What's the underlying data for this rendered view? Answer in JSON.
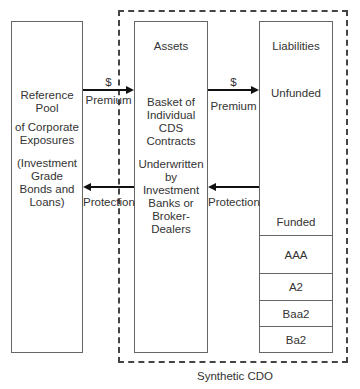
{
  "reference_pool": {
    "line1": "Reference",
    "line2": "Pool",
    "line3": "of Corporate",
    "line4": "Exposures",
    "line5": "(Investment",
    "line6": "Grade",
    "line7": "Bonds and",
    "line8": "Loans)"
  },
  "assets": {
    "title": "Assets",
    "desc1": "Basket of",
    "desc2": "Individual",
    "desc3": "CDS",
    "desc4": "Contracts",
    "desc5": "Underwritten",
    "desc6": "by",
    "desc7": "Investment",
    "desc8": "Banks or",
    "desc9": "Broker-",
    "desc10": "Dealers"
  },
  "liabilities": {
    "title": "Liabilities",
    "unfunded": "Unfunded",
    "funded": "Funded",
    "tranches": [
      "AAA",
      "A2",
      "Baa2",
      "Ba2"
    ]
  },
  "flows": {
    "left_premium_symbol": "$",
    "left_premium_label": "Premium",
    "left_protection_label": "Protection",
    "right_premium_symbol": "$",
    "right_premium_label": "Premium",
    "right_protection_label": "Protection"
  },
  "frame_label": "Synthetic CDO"
}
